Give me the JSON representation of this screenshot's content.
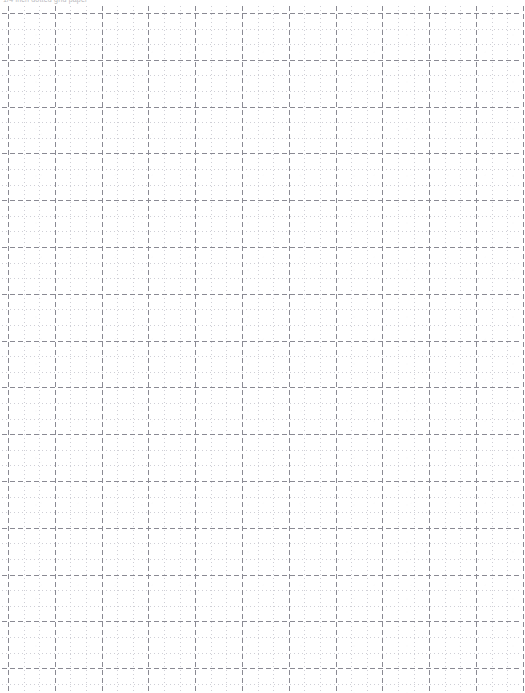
{
  "document": {
    "title": "Dotted Grid Paper",
    "header_text": "1/4 inch dotted grid paper",
    "page_width_px": 525,
    "page_height_px": 693,
    "background_color": "#ffffff"
  },
  "grid": {
    "label": "dotted graph paper grid",
    "minor": {
      "name": "minor-gridlines",
      "spacing_px": 15.6,
      "color": "#cfcfd6",
      "stroke_width": 1,
      "dash_pattern": "1 3",
      "style": "dotted"
    },
    "major": {
      "name": "major-gridlines",
      "spacing_px": 46.8,
      "every_n_minor": 3,
      "color": "#8a8a93",
      "stroke_width": 1,
      "dash_pattern": "5 3",
      "style": "dashed"
    },
    "origin": {
      "x_px": 8,
      "y_px": 13
    },
    "extent": {
      "left_px": 2,
      "top_px": 6,
      "right_px": 522,
      "bottom_px": 693
    },
    "counts": {
      "vertical_lines": 34,
      "horizontal_lines": 44,
      "vertical_major_lines": 12,
      "horizontal_major_lines": 15
    }
  }
}
